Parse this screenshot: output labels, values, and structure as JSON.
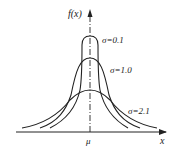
{
  "diagram": {
    "axes": {
      "y_label": "f(x)",
      "x_label": "x",
      "center_label": "μ"
    },
    "curves": [
      {
        "name": "narrow",
        "label": "σ=0.1"
      },
      {
        "name": "medium",
        "label": "σ=1.0"
      },
      {
        "name": "wide",
        "label": "σ=2.1"
      }
    ],
    "colors": {
      "line": "#222222",
      "background": "#ffffff"
    }
  }
}
